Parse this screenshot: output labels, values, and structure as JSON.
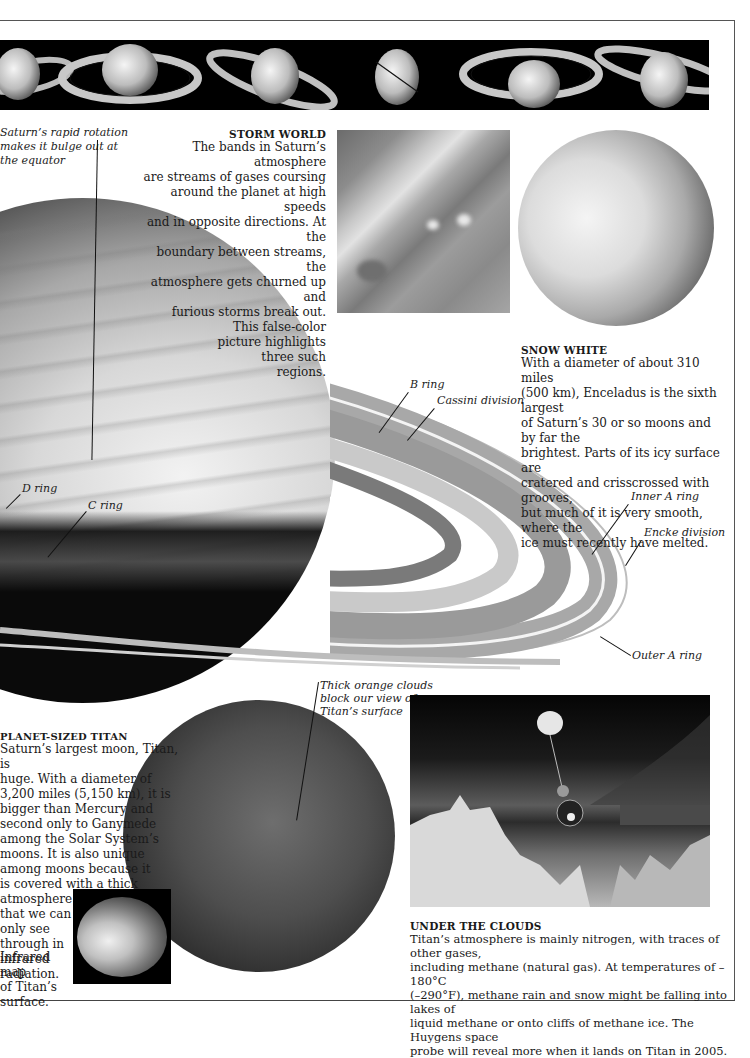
{
  "page": {
    "strip": {
      "description": "Sequence of six views of Saturn showing changing ring tilt",
      "views": [
        "saturn-tilt-1",
        "saturn-tilt-2",
        "saturn-tilt-3",
        "saturn-edge-on",
        "saturn-tilt-5",
        "saturn-tilt-6"
      ]
    },
    "saturn_bulge_label": {
      "lines": [
        "Saturn’s rapid rotation",
        "makes it bulge out at",
        "the equator"
      ]
    },
    "storm_world": {
      "heading": "STORM WORLD",
      "lines": [
        "The bands in Saturn’s atmosphere",
        "are streams of gases coursing",
        "around the planet at high speeds",
        "and in opposite directions. At the",
        "boundary between streams, the",
        "atmosphere gets churned up and",
        "furious storms break out.",
        "This false-color",
        "picture highlights",
        "three such",
        "regions."
      ]
    },
    "snow_white": {
      "heading": "SNOW WHITE",
      "lines": [
        "With a diameter of about 310 miles",
        "(500 km), Enceladus is the sixth largest",
        "of Saturn’s 30 or so moons and by far the",
        "brightest. Parts of its icy surface are",
        "cratered and crisscrossed with grooves,",
        "but much of it is very smooth, where the",
        "ice must recently have melted."
      ]
    },
    "ring_labels": {
      "b_ring": "B ring",
      "cassini": "Cassini division",
      "d_ring": "D ring",
      "c_ring": "C ring",
      "inner_a": "Inner A ring",
      "encke": "Encke division",
      "outer_a": "Outer A ring"
    },
    "titan_cloud_label": {
      "lines": [
        "Thick orange clouds",
        "block our view of",
        "Titan’s surface"
      ]
    },
    "planet_sized_titan": {
      "heading": "PLANET-SIZED TITAN",
      "lines": [
        "Saturn’s largest moon, Titan, is",
        "huge. With a diameter of",
        "3,200 miles (5,150 km), it is",
        "bigger than Mercury and",
        "second only to Ganymede",
        "among the Solar System’s",
        "moons. It is also unique",
        "among moons because it",
        "is covered with a thick",
        "atmosphere",
        "that we can",
        "only see",
        "through in",
        "infrared",
        "radiation."
      ]
    },
    "ir_caption": {
      "lines": [
        "Infrared map",
        "of Titan’s",
        "surface."
      ]
    },
    "under_the_clouds": {
      "heading": "UNDER THE CLOUDS",
      "lines": [
        "Titan’s atmosphere is mainly nitrogen, with traces of other gases,",
        "including methane (natural gas). At temperatures of –180°C",
        "(–290°F), methane rain and snow might be falling into lakes of",
        "liquid methane or onto cliffs of methane ice. The Huygens space",
        "probe will reveal more when it lands on Titan in 2005."
      ]
    }
  }
}
